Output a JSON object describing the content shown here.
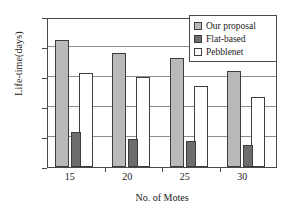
{
  "chart_data": {
    "type": "bar",
    "title": "",
    "xlabel": "No. of Motes",
    "ylabel": "Life-time(days)",
    "categories": [
      "15",
      "20",
      "25",
      "30"
    ],
    "series": [
      {
        "name": "Our proposal",
        "color": "#b9b9b9",
        "values": [
          21.1,
          19.0,
          18.2,
          16.0
        ]
      },
      {
        "name": "Flat-based",
        "color": "#6d6d6d",
        "values": [
          5.8,
          4.7,
          4.3,
          3.6
        ]
      },
      {
        "name": "Pebblenet",
        "color": "#ffffff",
        "values": [
          15.7,
          15.0,
          13.5,
          11.6
        ]
      }
    ],
    "ylim": [
      0,
      25
    ],
    "yticks": [
      0,
      5,
      10,
      15,
      20,
      25
    ],
    "gridlines": [
      5,
      10,
      15,
      20
    ],
    "grid": true,
    "legend_position": "top-right"
  },
  "legend": {
    "entries": [
      {
        "label": "Our proposal"
      },
      {
        "label": "Flat-based"
      },
      {
        "label": "Pebblenet"
      }
    ]
  }
}
